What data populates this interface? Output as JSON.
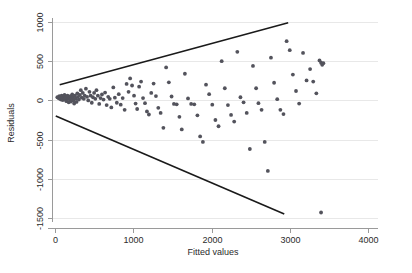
{
  "chart_data": {
    "type": "scatter",
    "title": "",
    "subtitle": "",
    "xlabel": "Fitted values",
    "ylabel": "Residuals",
    "xlim": [
      0,
      4000
    ],
    "ylim": [
      -1500,
      1000
    ],
    "xticks": [
      0,
      1000,
      2000,
      3000,
      4000
    ],
    "xtick_labels": [
      "0",
      "1000",
      "2000",
      "3000",
      "4000"
    ],
    "yticks": [
      -1500,
      -1000,
      -500,
      0,
      500,
      1000
    ],
    "ytick_labels": [
      "-1500",
      "-1000",
      "-500",
      "0",
      "500",
      "1000"
    ],
    "grid": "horizontal",
    "legend": null,
    "point_color": "#53535c",
    "line_color": "#1a1a1a",
    "grid_color": "#e8e8e8",
    "axis_color": "#9a9a9a",
    "annotations": [
      {
        "name": "upper-envelope",
        "type": "line",
        "x": [
          60,
          2980
        ],
        "y": [
          200,
          990
        ]
      },
      {
        "name": "lower-envelope",
        "type": "line",
        "x": [
          10,
          2930
        ],
        "y": [
          -200,
          -1450
        ]
      }
    ],
    "series": [
      {
        "name": "residuals",
        "points": [
          [
            30,
            40
          ],
          [
            45,
            30
          ],
          [
            55,
            55
          ],
          [
            62,
            20
          ],
          [
            70,
            45
          ],
          [
            78,
            10
          ],
          [
            85,
            60
          ],
          [
            92,
            30
          ],
          [
            100,
            5
          ],
          [
            108,
            50
          ],
          [
            115,
            25
          ],
          [
            122,
            70
          ],
          [
            130,
            15
          ],
          [
            138,
            40
          ],
          [
            145,
            -10
          ],
          [
            152,
            35
          ],
          [
            160,
            60
          ],
          [
            168,
            20
          ],
          [
            175,
            -25
          ],
          [
            182,
            45
          ],
          [
            190,
            10
          ],
          [
            198,
            55
          ],
          [
            205,
            -15
          ],
          [
            212,
            30
          ],
          [
            220,
            75
          ],
          [
            228,
            40
          ],
          [
            236,
            0
          ],
          [
            245,
            -40
          ],
          [
            255,
            60
          ],
          [
            265,
            25
          ],
          [
            275,
            -20
          ],
          [
            285,
            90
          ],
          [
            295,
            45
          ],
          [
            305,
            10
          ],
          [
            318,
            70
          ],
          [
            330,
            130
          ],
          [
            342,
            35
          ],
          [
            355,
            95
          ],
          [
            368,
            20
          ],
          [
            380,
            60
          ],
          [
            395,
            150
          ],
          [
            410,
            45
          ],
          [
            425,
            0
          ],
          [
            440,
            110
          ],
          [
            455,
            60
          ],
          [
            470,
            -30
          ],
          [
            485,
            40
          ],
          [
            500,
            95
          ],
          [
            515,
            20
          ],
          [
            530,
            130
          ],
          [
            548,
            60
          ],
          [
            565,
            -45
          ],
          [
            582,
            30
          ],
          [
            600,
            75
          ],
          [
            620,
            10
          ],
          [
            640,
            100
          ],
          [
            660,
            -60
          ],
          [
            680,
            45
          ],
          [
            700,
            20
          ],
          [
            720,
            -90
          ],
          [
            745,
            165
          ],
          [
            765,
            35
          ],
          [
            790,
            -30
          ],
          [
            815,
            80
          ],
          [
            840,
            -55
          ],
          [
            865,
            30
          ],
          [
            890,
            -120
          ],
          [
            915,
            210
          ],
          [
            940,
            110
          ],
          [
            960,
            280
          ],
          [
            985,
            190
          ],
          [
            1010,
            60
          ],
          [
            1030,
            -40
          ],
          [
            1050,
            -110
          ],
          [
            1075,
            175
          ],
          [
            1100,
            240
          ],
          [
            1125,
            30
          ],
          [
            1150,
            -35
          ],
          [
            1175,
            -140
          ],
          [
            1200,
            -180
          ],
          [
            1230,
            95
          ],
          [
            1260,
            215
          ],
          [
            1290,
            55
          ],
          [
            1320,
            -95
          ],
          [
            1350,
            -160
          ],
          [
            1385,
            -350
          ],
          [
            1420,
            420
          ],
          [
            1455,
            230
          ],
          [
            1490,
            50
          ],
          [
            1520,
            -45
          ],
          [
            1555,
            -50
          ],
          [
            1590,
            -210
          ],
          [
            1620,
            -370
          ],
          [
            1660,
            340
          ],
          [
            1700,
            25
          ],
          [
            1740,
            -45
          ],
          [
            1780,
            -50
          ],
          [
            1820,
            -190
          ],
          [
            1855,
            -460
          ],
          [
            1890,
            -530
          ],
          [
            1930,
            200
          ],
          [
            1970,
            80
          ],
          [
            2010,
            -55
          ],
          [
            2050,
            -250
          ],
          [
            2090,
            -330
          ],
          [
            2130,
            500
          ],
          [
            2170,
            155
          ],
          [
            2210,
            -60
          ],
          [
            2250,
            -185
          ],
          [
            2290,
            -270
          ],
          [
            2330,
            620
          ],
          [
            2370,
            40
          ],
          [
            2410,
            -25
          ],
          [
            2450,
            -160
          ],
          [
            2490,
            -620
          ],
          [
            2530,
            440
          ],
          [
            2570,
            155
          ],
          [
            2600,
            -35
          ],
          [
            2640,
            -120
          ],
          [
            2680,
            -530
          ],
          [
            2720,
            -900
          ],
          [
            2760,
            545
          ],
          [
            2800,
            225
          ],
          [
            2840,
            15
          ],
          [
            2880,
            -120
          ],
          [
            2920,
            -175
          ],
          [
            2960,
            755
          ],
          [
            3000,
            640
          ],
          [
            3040,
            330
          ],
          [
            3080,
            120
          ],
          [
            3120,
            -40
          ],
          [
            3170,
            605
          ],
          [
            3215,
            255
          ],
          [
            3260,
            400
          ],
          [
            3300,
            240
          ],
          [
            3340,
            90
          ],
          [
            3380,
            510
          ],
          [
            3400,
            480
          ],
          [
            3415,
            455
          ],
          [
            3430,
            475
          ],
          [
            3400,
            -1430
          ]
        ]
      }
    ]
  },
  "axes": {
    "x_title": "Fitted values",
    "y_title": "Residuals"
  }
}
